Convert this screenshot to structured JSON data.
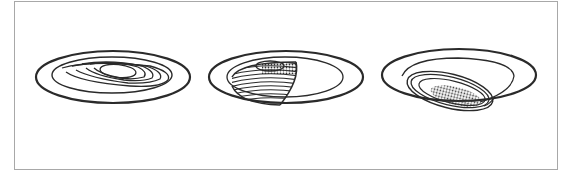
{
  "figure": {
    "items": [
      {
        "id": "fixture-1",
        "label": "Step baffle trim"
      },
      {
        "id": "fixture-2",
        "label": "Wall wash trim"
      },
      {
        "id": "fixture-3",
        "label": "Eyeball trim"
      }
    ],
    "colors": {
      "stroke": "#2a2a2a",
      "frame": "#a8a8a8",
      "background": "#ffffff"
    }
  }
}
